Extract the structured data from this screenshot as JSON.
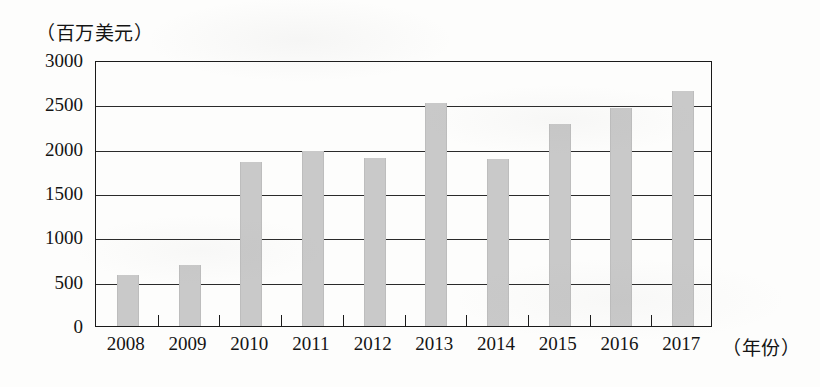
{
  "chart_data": {
    "type": "bar",
    "title": "",
    "subtitle": "",
    "xlabel": "（年份）",
    "ylabel": "（百万美元）",
    "categories": [
      "2008",
      "2009",
      "2010",
      "2011",
      "2012",
      "2013",
      "2014",
      "2015",
      "2016",
      "2017"
    ],
    "values": [
      580,
      690,
      1850,
      1970,
      1890,
      2510,
      1880,
      2280,
      2460,
      2650
    ],
    "series": [
      {
        "name": "",
        "values": [
          580,
          690,
          1850,
          1970,
          1890,
          2510,
          1880,
          2280,
          2460,
          2650
        ]
      }
    ],
    "ylim": [
      0,
      3000
    ],
    "ytick_labels": [
      "0",
      "500",
      "1000",
      "1500",
      "2000",
      "2500",
      "3000"
    ],
    "ytick_values": [
      0,
      500,
      1000,
      1500,
      2000,
      2500,
      3000
    ],
    "grid": true,
    "grid_axis": "y",
    "legend": false,
    "legend_position": "none",
    "bar_color": "#c9c9c9",
    "axis_color": "#1a1a1a",
    "background": "#fdfdfc"
  },
  "axes": {
    "y_unit_caption": "（百万美元）",
    "x_unit_caption": "（年份）"
  }
}
